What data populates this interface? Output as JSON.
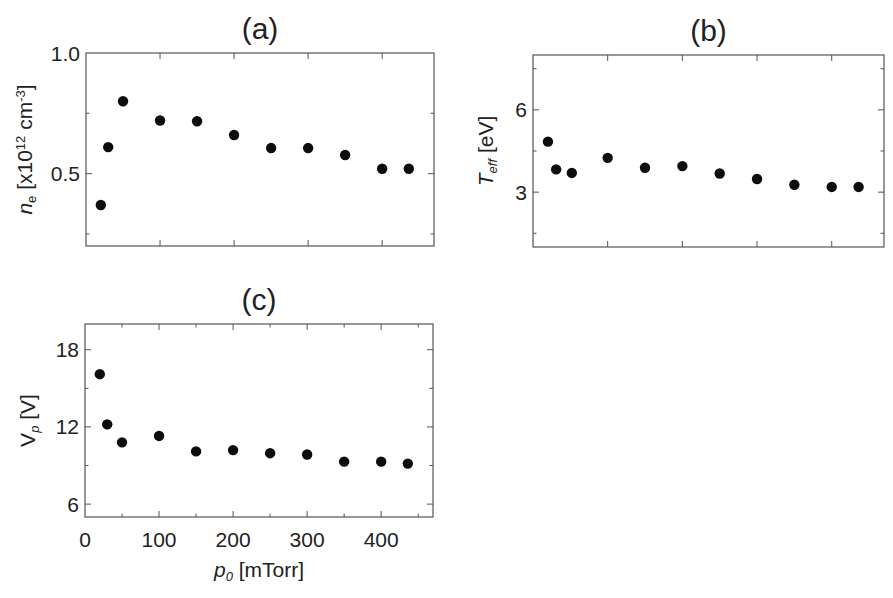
{
  "figure": {
    "x_axis_label_main": "p",
    "x_axis_label_sub": "0",
    "x_axis_label_unit": " [mTorr]"
  },
  "chart_data": [
    {
      "id": "a",
      "type": "scatter",
      "title": "(a)",
      "xlabel": "",
      "ylabel": "n_e [x10^12 cm^-3]",
      "ylabel_parts": {
        "main": "n",
        "sub": "e",
        "unit_prefix": " [x10",
        "exp": "12",
        "unit_mid": " cm",
        "exp2": "-3",
        "unit_suffix": "]"
      },
      "xlim": [
        0,
        470
      ],
      "ylim": [
        0.2,
        1.0
      ],
      "xticks_major": [
        0,
        100,
        200,
        300,
        400
      ],
      "xticks_minor": [],
      "xtick_labels_shown": false,
      "yticks_major": [
        0.5,
        1.0
      ],
      "ytick_labels": [
        "0.5",
        "1.0"
      ],
      "yticks_minor": [
        0.25,
        0.75
      ],
      "grid": false,
      "x": [
        20,
        30,
        50,
        100,
        150,
        200,
        250,
        300,
        350,
        400,
        436
      ],
      "y": [
        0.37,
        0.61,
        0.8,
        0.72,
        0.717,
        0.66,
        0.606,
        0.606,
        0.577,
        0.52,
        0.52
      ],
      "frame_px": {
        "left": 86,
        "top": 53,
        "right": 434,
        "bottom": 246
      }
    },
    {
      "id": "b",
      "type": "scatter",
      "title": "(b)",
      "xlabel": "",
      "ylabel": "T_eff [eV]",
      "ylabel_parts": {
        "main": "T",
        "sub": "eff",
        "unit": " [eV]"
      },
      "xlim": [
        0,
        470
      ],
      "ylim": [
        1,
        8
      ],
      "xticks_major": [
        0,
        100,
        200,
        300,
        400
      ],
      "xticks_minor": [],
      "xtick_labels_shown": false,
      "yticks_major": [
        3,
        6
      ],
      "ytick_labels": [
        "3",
        "6"
      ],
      "yticks_minor": [
        1.5,
        4.5,
        7.5
      ],
      "grid": false,
      "x": [
        20,
        31,
        52,
        100,
        150,
        200,
        250,
        300,
        350,
        400,
        436
      ],
      "y": [
        4.84,
        3.83,
        3.7,
        4.25,
        3.89,
        3.95,
        3.68,
        3.48,
        3.27,
        3.19,
        3.19
      ],
      "frame_px": {
        "left": 533,
        "top": 55,
        "right": 884,
        "bottom": 247
      }
    },
    {
      "id": "c",
      "type": "scatter",
      "title": "(c)",
      "xlabel": "p_0 [mTorr]",
      "ylabel": "V_p [V]",
      "ylabel_parts": {
        "main": "V",
        "sub": "p",
        "unit": " [V]"
      },
      "xlim": [
        0,
        470
      ],
      "ylim": [
        5,
        20
      ],
      "xticks_major": [
        0,
        100,
        200,
        300,
        400
      ],
      "xtick_labels": [
        "0",
        "100",
        "200",
        "300",
        "400"
      ],
      "xticks_minor": [
        50,
        150,
        250,
        350,
        450
      ],
      "xtick_labels_shown": true,
      "yticks_major": [
        6,
        12,
        18
      ],
      "ytick_labels": [
        "6",
        "12",
        "18"
      ],
      "yticks_minor": [
        9,
        15
      ],
      "grid": false,
      "x": [
        20,
        30,
        50,
        100,
        150,
        200,
        250,
        300,
        350,
        400,
        436
      ],
      "y": [
        16.1,
        12.2,
        10.8,
        11.3,
        10.1,
        10.2,
        9.96,
        9.86,
        9.3,
        9.3,
        9.15
      ],
      "frame_px": {
        "left": 85,
        "top": 324,
        "right": 433,
        "bottom": 517
      }
    }
  ]
}
